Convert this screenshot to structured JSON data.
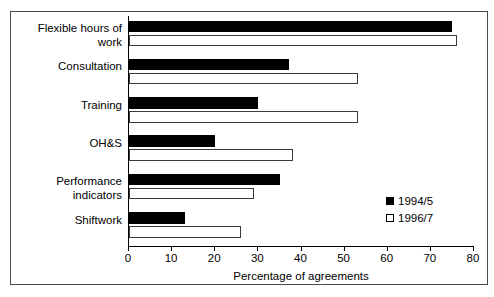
{
  "chart_data": {
    "type": "bar",
    "orientation": "horizontal",
    "title": "",
    "xlabel": "Percentage of agreements",
    "ylabel": "",
    "xlim": [
      0,
      80
    ],
    "xticks": [
      0,
      10,
      20,
      30,
      40,
      50,
      60,
      70,
      80
    ],
    "grid": false,
    "legend_position": "inside-right",
    "categories": [
      "Flexible hours of\nwork",
      "Consultation",
      "Training",
      "OH&S",
      "Performance\nindicators",
      "Shiftwork"
    ],
    "series": [
      {
        "name": "1994/5",
        "color": "#000000",
        "fill": "solid",
        "values": [
          75,
          37,
          30,
          20,
          35,
          13
        ]
      },
      {
        "name": "1996/7",
        "color": "#ffffff",
        "fill": "outline",
        "values": [
          76,
          53,
          53,
          38,
          29,
          26
        ]
      }
    ]
  },
  "legend": {
    "entries": [
      {
        "label": "1994/5"
      },
      {
        "label": "1996/7"
      }
    ]
  }
}
